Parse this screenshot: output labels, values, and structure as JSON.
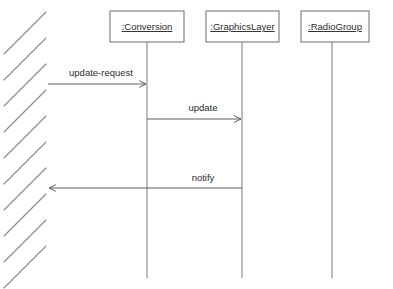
{
  "diagram": {
    "type": "uml-sequence-diagram",
    "width": 393,
    "height": 289,
    "background_color": "#ffffff",
    "line_color": "#5f7a7a",
    "text_color": "#2b2b2b",
    "boundary": {
      "name": "hatched-boundary",
      "description": "diagonal hatch lines along left edge",
      "stroke_color": "#8a8a8a",
      "line_count": 10,
      "angle_degrees": 45,
      "x_start": 4,
      "x_end": 46,
      "spacing": 26,
      "first_y": 12
    },
    "lifelines": [
      {
        "id": "conversion",
        "label": ":Conversion",
        "box_x": 110,
        "box_y": 11,
        "box_width": 74,
        "box_height": 31,
        "line_x": 147,
        "line_top": 42,
        "line_bottom": 278
      },
      {
        "id": "graphicslayer",
        "label": ":GraphicsLayer",
        "box_x": 206,
        "box_y": 11,
        "box_width": 73,
        "box_height": 31,
        "line_x": 242,
        "line_top": 42,
        "line_bottom": 278
      },
      {
        "id": "radiogroup",
        "label": ":RadioGroup",
        "box_x": 301,
        "box_y": 11,
        "box_width": 68,
        "box_height": 31,
        "line_x": 332,
        "line_top": 42,
        "line_bottom": 278
      }
    ],
    "messages": [
      {
        "id": "update-request",
        "label": "update-request",
        "from": "boundary",
        "to": "conversion",
        "direction": "right",
        "x_start": 48,
        "x_end": 146,
        "y": 84,
        "label_x": 101,
        "label_y": 76
      },
      {
        "id": "update",
        "label": "update",
        "from": "conversion",
        "to": "graphicslayer",
        "direction": "right",
        "x_start": 147,
        "x_end": 241,
        "y": 119,
        "label_x": 203,
        "label_y": 111
      },
      {
        "id": "notify",
        "label": "notify",
        "from": "graphicslayer",
        "to": "boundary",
        "direction": "left",
        "x_start": 242,
        "x_end": 49,
        "y": 188,
        "label_x": 203,
        "label_y": 181
      }
    ]
  }
}
